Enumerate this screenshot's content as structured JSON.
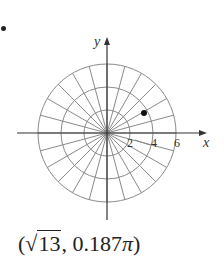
{
  "marker": "•",
  "axes": {
    "x_label": "x",
    "y_label": "y",
    "ticks": [
      "2",
      "4",
      "6"
    ]
  },
  "caption": {
    "open": "(",
    "sqrt_arg": "13",
    "sep": ", 0.187",
    "pi": "π",
    "close": ")"
  },
  "chart_data": {
    "type": "scatter",
    "title": "",
    "xlabel": "x",
    "ylabel": "y",
    "coordinate_system": "polar grid",
    "rings": [
      2,
      4,
      6
    ],
    "spokes_deg_step": 15,
    "tick_labels": [
      "2",
      "4",
      "6"
    ],
    "points": [
      {
        "r": 3.606,
        "theta_pi": 0.187,
        "label": "(√13, 0.187π)"
      }
    ],
    "grid": true
  }
}
